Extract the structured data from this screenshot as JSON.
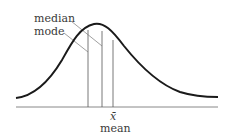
{
  "diagram": {
    "labels": {
      "median": "median",
      "mode": "mode",
      "xbar": "x̄",
      "mean": "mean"
    },
    "colors": {
      "curve": "#1a1a1a",
      "lines": "#555555",
      "baseline": "#888888",
      "text": "#3a3a3a"
    },
    "positions": {
      "mode_x": 88,
      "median_x": 102,
      "mean_x": 113,
      "baseline_y": 107
    }
  }
}
